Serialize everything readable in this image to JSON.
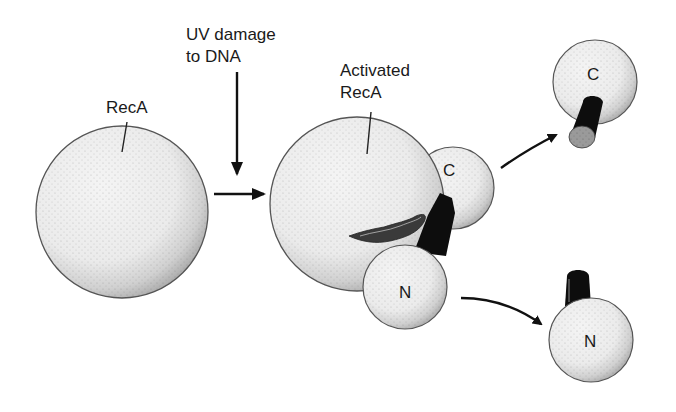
{
  "labels": {
    "reca": "RecA",
    "uv_line1": "UV damage",
    "uv_line2": "to DNA",
    "activated_line1": "Activated",
    "activated_line2": "RecA",
    "c_domain_bound": "C",
    "n_domain_bound": "N",
    "c_domain_free": "C",
    "n_domain_free": "N"
  },
  "colors": {
    "sphere_fill": "#eeeeee",
    "sphere_stroke": "#555555",
    "stipple": "#444444",
    "cylinder": "#0d0d0d",
    "arrow": "#111111"
  }
}
